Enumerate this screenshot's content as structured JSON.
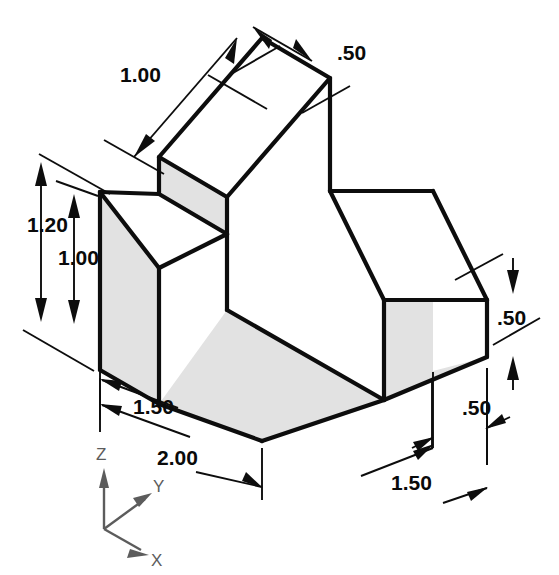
{
  "drawing": {
    "type": "isometric-pictorial",
    "title": "",
    "units": "inches",
    "dimensions": [
      {
        "id": "top-width",
        "label": "1.00",
        "x": 120,
        "y": 82,
        "anchor": "start"
      },
      {
        "id": "top-depth",
        "label": ".50",
        "x": 337,
        "y": 60,
        "anchor": "start"
      },
      {
        "id": "overall-height",
        "label": "1.20",
        "x": 27,
        "y": 232,
        "anchor": "start"
      },
      {
        "id": "step-height",
        "label": "1.00",
        "x": 58,
        "y": 265,
        "anchor": "start"
      },
      {
        "id": "right-height",
        "label": ".50",
        "x": 497,
        "y": 325,
        "anchor": "start"
      },
      {
        "id": "right-thickness",
        "label": ".50",
        "x": 462,
        "y": 415,
        "anchor": "start"
      },
      {
        "id": "front-left-width",
        "label": "1.50",
        "x": 133,
        "y": 414,
        "anchor": "start"
      },
      {
        "id": "front-overall",
        "label": "2.00",
        "x": 157,
        "y": 465,
        "anchor": "start"
      },
      {
        "id": "front-right-run",
        "label": "1.50",
        "x": 391,
        "y": 490,
        "anchor": "start"
      }
    ],
    "axes": {
      "origin_label": "",
      "z_label": "Z",
      "y_label": "Y",
      "x_label": "X"
    },
    "colors": {
      "edge": "#0d0d0d",
      "shaded_face": "#e2e2e2",
      "plain_face": "#ffffff",
      "axis": "#5c5c5c",
      "background": "#ffffff"
    }
  }
}
